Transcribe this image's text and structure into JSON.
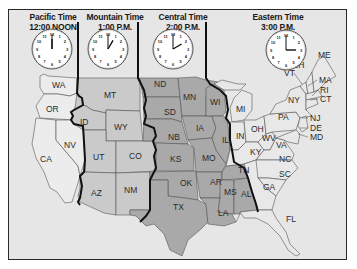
{
  "colors": {
    "background": "#e6e6e6",
    "pacific": "#e9e9e9",
    "mountain": "#c9c9c9",
    "central": "#a9a9a9",
    "eastern": "#e6e6e6",
    "border": "#2a2a2a",
    "clock_face": "#ffffff"
  },
  "zones": [
    {
      "name": "Pacific Time",
      "time": "12:00 NOON",
      "hour": 12,
      "minute": 0
    },
    {
      "name": "Mountain Time",
      "time": "1:00 P.M.",
      "hour": 1,
      "minute": 0
    },
    {
      "name": "Central Time",
      "time": "2:00 P.M.",
      "hour": 2,
      "minute": 0
    },
    {
      "name": "Eastern Time",
      "time": "3:00 P.M.",
      "hour": 3,
      "minute": 0
    }
  ],
  "states": {
    "pacific": [
      "WA",
      "OR",
      "CA",
      "NV"
    ],
    "mountain": [
      "MT",
      "ID",
      "WY",
      "UT",
      "CO",
      "AZ",
      "NM"
    ],
    "central": [
      "ND",
      "SD",
      "NB",
      "KS",
      "OK",
      "TX",
      "MN",
      "IA",
      "MO",
      "AR",
      "LA",
      "WI",
      "IL",
      "TN",
      "MS",
      "AL"
    ],
    "eastern": [
      "MI",
      "IN",
      "OH",
      "KY",
      "WV",
      "VA",
      "PA",
      "NY",
      "VT",
      "NH",
      "ME",
      "MA",
      "RI",
      "CT",
      "NJ",
      "DE",
      "MD",
      "NC",
      "SC",
      "GA",
      "FL"
    ]
  },
  "labels": {
    "WA": "WA",
    "OR": "OR",
    "CA": "CA",
    "NV": "NV",
    "MT": "MT",
    "ID": "ID",
    "WY": "WY",
    "UT": "UT",
    "CO": "CO",
    "AZ": "AZ",
    "NM": "NM",
    "ND": "ND",
    "SD": "SD",
    "NB": "NB",
    "KS": "KS",
    "OK": "OK",
    "TX": "TX",
    "MN": "MN",
    "IA": "IA",
    "MO": "MO",
    "AR": "AR",
    "LA": "LA",
    "WI": "WI",
    "IL": "IL",
    "TN": "TN",
    "MS": "MS",
    "AL": "AL",
    "MI": "MI",
    "IN": "IN",
    "OH": "OH",
    "KY": "KY",
    "WV": "WV",
    "VA": "VA",
    "PA": "PA",
    "NY": "NY",
    "VT": "VT",
    "NH": "NH",
    "ME": "ME",
    "MA": "MA",
    "RI": "RI",
    "CT": "CT",
    "NJ": "NJ",
    "DE": "DE",
    "MD": "MD",
    "NC": "NC",
    "SC": "SC",
    "GA": "GA",
    "FL": "FL"
  },
  "clock_numbers": [
    "12",
    "1",
    "2",
    "3",
    "4",
    "5",
    "6",
    "7",
    "8",
    "9",
    "10",
    "11"
  ]
}
